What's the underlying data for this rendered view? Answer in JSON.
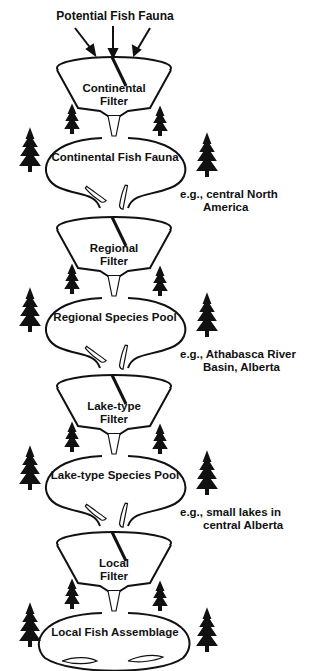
{
  "title": "Potential Fish Fauna",
  "stages": [
    {
      "filter": [
        "Continental",
        "Filter"
      ],
      "pool": "Continental Fish Fauna",
      "example": [
        "e.g., central North",
        "America"
      ]
    },
    {
      "filter": [
        "Regional",
        "Filter"
      ],
      "pool": "Regional Species Pool",
      "example": [
        "e.g., Athabasca River",
        "Basin, Alberta"
      ]
    },
    {
      "filter": [
        "Lake-type",
        "Filter"
      ],
      "pool": "Lake-type Species Pool",
      "example": [
        "e.g., small lakes in",
        "central Alberta"
      ]
    },
    {
      "filter": [
        "Local",
        "Filter"
      ],
      "pool": "Local Fish Assemblage",
      "example": [
        "e.g., Canoe Lake,",
        "Alberta"
      ]
    }
  ],
  "colors": {
    "ink": "#111111",
    "background": "#ffffff"
  }
}
